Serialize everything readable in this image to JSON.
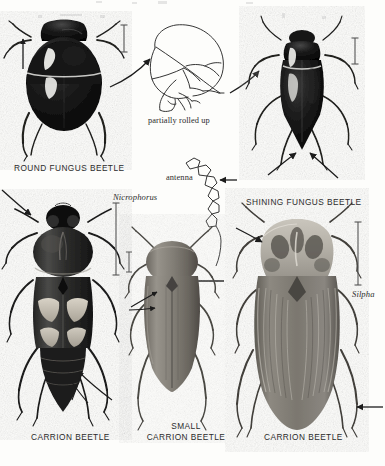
{
  "plate": {
    "title": "Beetle identification plate",
    "background_color": "#fdfdfb",
    "ink_color": "#1c1c1c"
  },
  "captions": {
    "round_fungus_beetle": "ROUND FUNGUS BEETLE",
    "shining_fungus_beetle": "SHINING FUNGUS BEETLE",
    "carrion_beetle_left": "CARRION BEETLE",
    "small_carrion_beetle_line1": "SMALL",
    "small_carrion_beetle_line2": "CARRION BEETLE",
    "carrion_beetle_right": "CARRION BEETLE"
  },
  "annotations": {
    "partially_rolled_up": "partially rolled up",
    "antenna": "antenna",
    "genus_nicrophorus": "Nicrophorus",
    "genus_silpha": "Silpha"
  },
  "figures": [
    {
      "name": "round-fungus-beetle",
      "caption": "ROUND FUNGUS BEETLE",
      "style": "halftone photograph",
      "notes": "dorsal view, glossy black rounded body with pale highlight on left elytron"
    },
    {
      "name": "partially-rolled-up-diagram",
      "caption": "partially rolled up",
      "style": "line drawing",
      "notes": "lateral view of beetle curled into a ball, legs folded"
    },
    {
      "name": "shining-fungus-beetle",
      "caption": "SHINING FUNGUS BEETLE",
      "style": "halftone photograph",
      "notes": "dorsal view, elongate black body with pointed abdomen tip"
    },
    {
      "name": "antenna-diagram",
      "caption": "antenna",
      "style": "line drawing",
      "notes": "segmented clubbed antenna with beaded apical segments"
    },
    {
      "name": "carrion-beetle-nicrophorus",
      "caption": "CARRION BEETLE",
      "genus": "Nicrophorus",
      "style": "halftone photograph",
      "notes": "dorsal view, short elytra with two pale orange bands, exposed abdomen"
    },
    {
      "name": "small-carrion-beetle",
      "caption": "SMALL CARRION BEETLE",
      "style": "halftone photograph",
      "notes": "dorsal view, oval dull grey-brown body"
    },
    {
      "name": "carrion-beetle-silpha",
      "caption": "CARRION BEETLE",
      "genus": "Silpha",
      "style": "halftone photograph",
      "notes": "dorsal view, broad flattened body, mottled pale pronotum, ribbed elytra"
    }
  ],
  "scale_bars": [
    {
      "name": "scale-bar-round-fungus-beetle"
    },
    {
      "name": "scale-bar-shining-fungus-beetle"
    },
    {
      "name": "scale-bar-nicrophorus"
    },
    {
      "name": "scale-bar-small-carrion-beetle"
    },
    {
      "name": "scale-bar-silpha"
    }
  ],
  "leader_arrows": [
    {
      "name": "arrow-round-to-rolled-up"
    },
    {
      "name": "arrow-rolled-up-to-shining"
    },
    {
      "name": "arrow-antenna-pointer"
    },
    {
      "name": "arrow-antenna-to-small-carrion"
    },
    {
      "name": "arrow-nicrophorus-antenna"
    },
    {
      "name": "arrow-nicrophorus-abdomen"
    },
    {
      "name": "arrow-small-carrion-elytra-upper"
    },
    {
      "name": "arrow-small-carrion-elytra-lower"
    },
    {
      "name": "arrow-silpha-antenna"
    },
    {
      "name": "arrow-silpha-leg"
    },
    {
      "name": "arrow-shining-abdomen"
    },
    {
      "name": "arrow-round-up"
    }
  ]
}
